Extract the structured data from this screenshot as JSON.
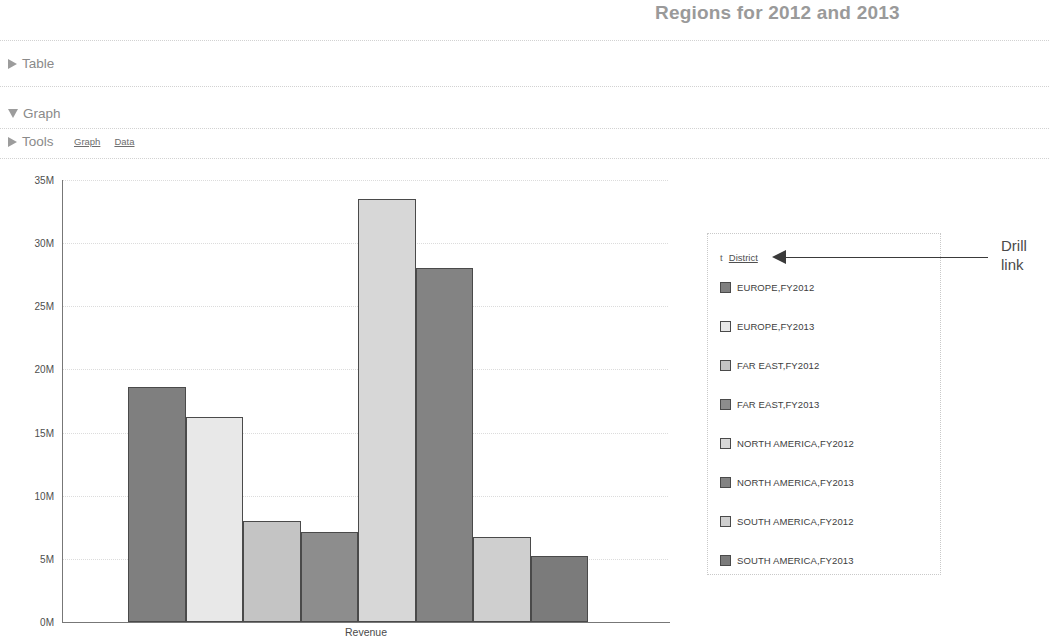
{
  "report": {
    "title": "Regions for 2012 and 2013"
  },
  "sections": {
    "table": {
      "label": "Table",
      "icon": "triangle-right-icon",
      "expanded": false
    },
    "graph": {
      "label": "Graph",
      "icon": "triangle-down-icon",
      "expanded": true
    },
    "tools": {
      "label": "Tools",
      "icon": "triangle-right-icon",
      "expanded": false,
      "links": [
        {
          "label": "Graph"
        },
        {
          "label": "Data"
        }
      ]
    }
  },
  "legend": {
    "sort_icon": "t",
    "title": "District",
    "title_is_link": true,
    "items": [
      {
        "label": "EUROPE,FY2012",
        "color": "#7f7f7f"
      },
      {
        "label": "EUROPE,FY2013",
        "color": "#e8e8e8"
      },
      {
        "label": "FAR EAST,FY2012",
        "color": "#c4c4c4"
      },
      {
        "label": "FAR EAST,FY2013",
        "color": "#8d8d8d"
      },
      {
        "label": "NORTH AMERICA,FY2012",
        "color": "#d7d7d7"
      },
      {
        "label": "NORTH AMERICA,FY2013",
        "color": "#838383"
      },
      {
        "label": "SOUTH AMERICA,FY2012",
        "color": "#cfcfcf"
      },
      {
        "label": "SOUTH AMERICA,FY2013",
        "color": "#7b7b7b"
      }
    ]
  },
  "annotation": {
    "text": "Drill link"
  },
  "chart_data": {
    "type": "bar",
    "title": "Regions for 2012 and 2013",
    "xlabel": "Revenue",
    "ylabel": "",
    "ylim": [
      0,
      35000000
    ],
    "ytick_labels": [
      "0M",
      "5M",
      "10M",
      "15M",
      "20M",
      "25M",
      "30M",
      "35M"
    ],
    "ytick_values": [
      0,
      5000000,
      10000000,
      15000000,
      20000000,
      25000000,
      30000000,
      35000000
    ],
    "grid": true,
    "legend_position": "right",
    "categories": [
      "EUROPE,FY2012",
      "EUROPE,FY2013",
      "FAR EAST,FY2012",
      "FAR EAST,FY2013",
      "NORTH AMERICA,FY2012",
      "NORTH AMERICA,FY2013",
      "SOUTH AMERICA,FY2012",
      "SOUTH AMERICA,FY2013"
    ],
    "values": [
      18600000,
      16200000,
      8000000,
      7100000,
      33500000,
      28000000,
      6700000,
      5200000
    ],
    "colors": [
      "#7f7f7f",
      "#e8e8e8",
      "#c4c4c4",
      "#8d8d8d",
      "#d7d7d7",
      "#838383",
      "#cfcfcf",
      "#7b7b7b"
    ]
  }
}
